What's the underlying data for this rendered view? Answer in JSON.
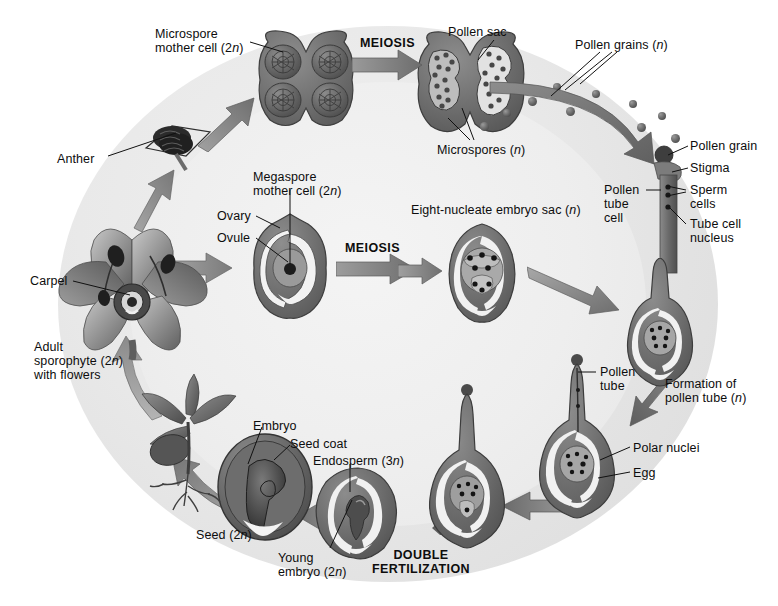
{
  "figure": {
    "background_outer": "#ffffff",
    "background_disc": "#e7e7e7",
    "ink": "#111111",
    "structure_fill": "#6e6e6e",
    "arrow_fill": "#7a7a7a"
  },
  "process_labels": [
    {
      "id": "meiosis-top",
      "text": "MEIOSIS",
      "x": 360,
      "y": 38
    },
    {
      "id": "meiosis-middle",
      "text": "MEIOSIS",
      "x": 345,
      "y": 243
    },
    {
      "id": "double-fert",
      "text": "DOUBLE\nFERTILIZATION",
      "x": 372,
      "y": 550
    }
  ],
  "labels": [
    {
      "id": "microspore-mother-cell",
      "text": "Microspore\nmother cell (2n)",
      "x": 155,
      "y": 27,
      "italic_n": true
    },
    {
      "id": "pollen-sac",
      "text": "Pollen sac",
      "x": 448,
      "y": 25,
      "italic_n": false
    },
    {
      "id": "pollen-grains",
      "text": "Pollen grains (n)",
      "x": 575,
      "y": 38,
      "italic_n": true
    },
    {
      "id": "microspores",
      "text": "Microspores (n)",
      "x": 437,
      "y": 143,
      "italic_n": true
    },
    {
      "id": "anther",
      "text": "Anther",
      "x": 57,
      "y": 152,
      "italic_n": false
    },
    {
      "id": "carpel",
      "text": "Carpel",
      "x": 30,
      "y": 277,
      "italic_n": false
    },
    {
      "id": "adult-sporophyte",
      "text": "Adult\nsporophyte (2n)\nwith flowers",
      "x": 34,
      "y": 340,
      "italic_n": true
    },
    {
      "id": "megaspore-mother-cell",
      "text": "Megaspore\nmother cell (2n)",
      "x": 253,
      "y": 170,
      "italic_n": true
    },
    {
      "id": "ovary",
      "text": "Ovary",
      "x": 217,
      "y": 210,
      "italic_n": false
    },
    {
      "id": "ovule",
      "text": "Ovule",
      "x": 217,
      "y": 232,
      "italic_n": false
    },
    {
      "id": "embryo-sac",
      "text": "Eight-nucleate embryo sac (n)",
      "x": 411,
      "y": 203,
      "italic_n": true
    },
    {
      "id": "pollen-grain",
      "text": "Pollen grain",
      "x": 690,
      "y": 139,
      "italic_n": false
    },
    {
      "id": "stigma",
      "text": "Stigma",
      "x": 690,
      "y": 163,
      "italic_n": false
    },
    {
      "id": "sperm-cells",
      "text": "Sperm\ncells",
      "x": 690,
      "y": 183,
      "italic_n": false
    },
    {
      "id": "tube-cell-nucleus",
      "text": "Tube cell\nnucleus",
      "x": 690,
      "y": 218,
      "italic_n": false
    },
    {
      "id": "pollen-tube-cell",
      "text": "Pollen\ntube\ncell",
      "x": 606,
      "y": 183,
      "italic_n": false
    },
    {
      "id": "pollen-tube",
      "text": "Pollen\ntube",
      "x": 600,
      "y": 366,
      "italic_n": false
    },
    {
      "id": "formation-pollen-tube",
      "text": "Formation of\npollen tube (n)",
      "x": 665,
      "y": 377,
      "italic_n": true
    },
    {
      "id": "polar-nuclei",
      "text": "Polar nuclei",
      "x": 632,
      "y": 442,
      "italic_n": false
    },
    {
      "id": "egg",
      "text": "Egg",
      "x": 632,
      "y": 467,
      "italic_n": false
    },
    {
      "id": "embryo",
      "text": "Embryo",
      "x": 253,
      "y": 419,
      "italic_n": false
    },
    {
      "id": "seed-coat",
      "text": "Seed coat",
      "x": 277,
      "y": 437,
      "italic_n": false
    },
    {
      "id": "seed",
      "text": "Seed (2n)",
      "x": 196,
      "y": 530,
      "italic_n": true
    },
    {
      "id": "endosperm",
      "text": "Endosperm (3n)",
      "x": 313,
      "y": 455,
      "italic_n": true
    },
    {
      "id": "young-embryo",
      "text": "Young\nembryo (2n)",
      "x": 278,
      "y": 552,
      "italic_n": true
    }
  ],
  "stages": [
    {
      "id": "microsporangium",
      "name": "Microsporangium with microspore mother cells"
    },
    {
      "id": "pollen-sac-stage",
      "name": "Pollen sac releasing pollen grains"
    },
    {
      "id": "flower-sporophyte",
      "name": "Adult sporophyte flower"
    },
    {
      "id": "ovary-ovule",
      "name": "Ovary containing ovule with megaspore mother cell"
    },
    {
      "id": "embryo-sac-stage",
      "name": "Eight-nucleate embryo sac"
    },
    {
      "id": "germinating-pollen",
      "name": "Germinating pollen grain on stigma"
    },
    {
      "id": "pollen-tube-ovule",
      "name": "Pollen tube growing toward ovule"
    },
    {
      "id": "fertilized-ovule",
      "name": "Ovule at double fertilization"
    },
    {
      "id": "young-seed",
      "name": "Young seed with endosperm and embryo"
    },
    {
      "id": "mature-seed",
      "name": "Mature seed with embryo and seed coat"
    },
    {
      "id": "seedling",
      "name": "Germinating seedling"
    }
  ]
}
